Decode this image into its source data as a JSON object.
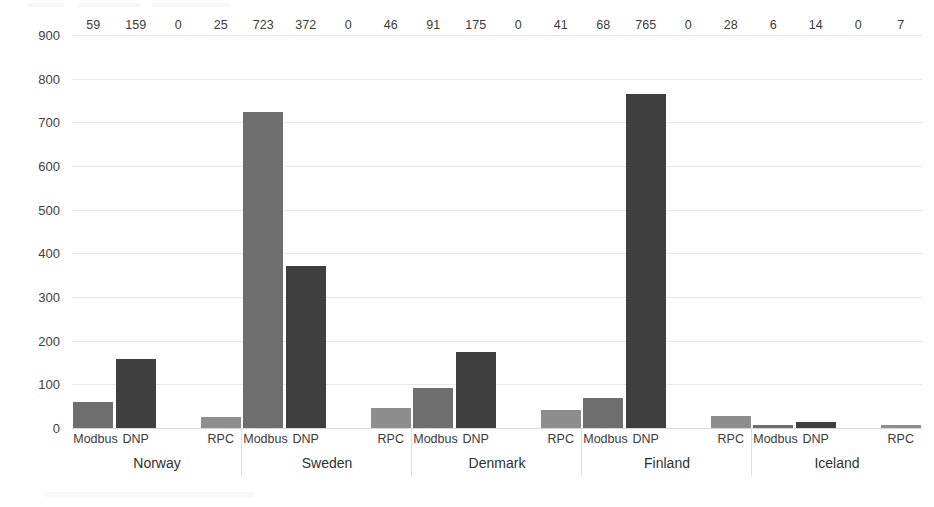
{
  "chart_data": {
    "type": "bar",
    "title": "",
    "subtitle": "",
    "xlabel": "",
    "ylabel": "",
    "ylim": [
      0,
      900
    ],
    "ytick_step": 100,
    "yticks": [
      0,
      100,
      200,
      300,
      400,
      500,
      600,
      700,
      800,
      900
    ],
    "grid": true,
    "legend": "none",
    "grouped": true,
    "categories": [
      "Norway",
      "Sweden",
      "Denmark",
      "Finland",
      "Iceland"
    ],
    "series": [
      {
        "name": "Modbus",
        "values": [
          59,
          723,
          91,
          68,
          6
        ]
      },
      {
        "name": "DNP",
        "values": [
          159,
          372,
          175,
          765,
          14
        ]
      },
      {
        "name": "zero",
        "values": [
          0,
          0,
          0,
          0,
          0
        ]
      },
      {
        "name": "RPC",
        "values": [
          25,
          46,
          41,
          28,
          7
        ]
      }
    ],
    "groups": [
      {
        "name": "Norway",
        "bars": [
          {
            "label": "Modbus",
            "value": 59,
            "value_text": "59",
            "kind": "modbus"
          },
          {
            "label": "DNP",
            "value": 159,
            "value_text": "159",
            "kind": "dnp"
          },
          {
            "label": "",
            "value": 0,
            "value_text": "0",
            "kind": "zero"
          },
          {
            "label": "RPC",
            "value": 25,
            "value_text": "25",
            "kind": "rpc"
          }
        ]
      },
      {
        "name": "Sweden",
        "bars": [
          {
            "label": "Modbus",
            "value": 723,
            "value_text": "723",
            "kind": "modbus"
          },
          {
            "label": "DNP",
            "value": 372,
            "value_text": "372",
            "kind": "dnp"
          },
          {
            "label": "",
            "value": 0,
            "value_text": "0",
            "kind": "zero"
          },
          {
            "label": "RPC",
            "value": 46,
            "value_text": "46",
            "kind": "rpc"
          }
        ]
      },
      {
        "name": "Denmark",
        "bars": [
          {
            "label": "Modbus",
            "value": 91,
            "value_text": "91",
            "kind": "modbus"
          },
          {
            "label": "DNP",
            "value": 175,
            "value_text": "175",
            "kind": "dnp"
          },
          {
            "label": "",
            "value": 0,
            "value_text": "0",
            "kind": "zero"
          },
          {
            "label": "RPC",
            "value": 41,
            "value_text": "41",
            "kind": "rpc"
          }
        ]
      },
      {
        "name": "Finland",
        "bars": [
          {
            "label": "Modbus",
            "value": 68,
            "value_text": "68",
            "kind": "modbus"
          },
          {
            "label": "DNP",
            "value": 765,
            "value_text": "765",
            "kind": "dnp"
          },
          {
            "label": "",
            "value": 0,
            "value_text": "0",
            "kind": "zero"
          },
          {
            "label": "RPC",
            "value": 28,
            "value_text": "28",
            "kind": "rpc"
          }
        ]
      },
      {
        "name": "Iceland",
        "bars": [
          {
            "label": "Modbus",
            "value": 6,
            "value_text": "6",
            "kind": "modbus"
          },
          {
            "label": "DNP",
            "value": 14,
            "value_text": "14",
            "kind": "dnp"
          },
          {
            "label": "",
            "value": 0,
            "value_text": "0",
            "kind": "zero"
          },
          {
            "label": "RPC",
            "value": 7,
            "value_text": "7",
            "kind": "rpc"
          }
        ]
      }
    ],
    "colors": {
      "modbus": "#6e6e6e",
      "dnp": "#3f3f3f",
      "rpc": "#8d8d8d",
      "grid": "#e8e8e8",
      "text": "#3b3b3b",
      "background": "#ffffff"
    }
  }
}
